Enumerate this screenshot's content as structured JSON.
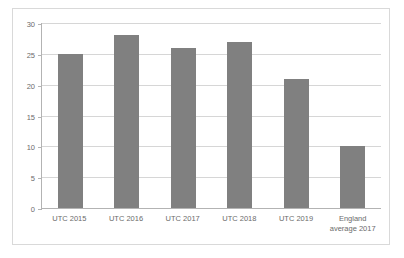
{
  "chart_data": {
    "type": "bar",
    "title": "",
    "subtitle": "",
    "xlabel": "",
    "ylabel": "",
    "ylim": [
      0,
      30
    ],
    "yticks": [
      0,
      5,
      10,
      15,
      20,
      25,
      30
    ],
    "grid": true,
    "legend": false,
    "legend_position": "none",
    "bar_color": "#808080",
    "categories": [
      "UTC 2015",
      "UTC 2016",
      "UTC 2017",
      "UTC 2018",
      "UTC 2019",
      "England average 2017"
    ],
    "category_lines": [
      [
        "UTC 2015"
      ],
      [
        "UTC 2016"
      ],
      [
        "UTC 2017"
      ],
      [
        "UTC 2018"
      ],
      [
        "UTC 2019"
      ],
      [
        "England",
        "average 2017"
      ]
    ],
    "values": [
      25,
      28,
      26,
      27,
      21,
      10
    ]
  },
  "colors": {
    "bar": "#808080",
    "gridline": "#d6d6d6",
    "axis": "#b3b3b3",
    "frame_border": "#d9d9d9",
    "tick_text": "#6b6b6b",
    "plot_background": "#ffffff"
  }
}
